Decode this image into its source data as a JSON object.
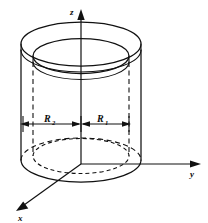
{
  "figure": {
    "kind": "technical-line-drawing",
    "background_color": "#ffffff",
    "line_color": "#111111"
  },
  "axes": {
    "z": {
      "label": "z",
      "direction": "up",
      "arrowhead": true
    },
    "y": {
      "label": "y",
      "direction": "right",
      "arrowhead": true
    },
    "x": {
      "label": "x",
      "direction": "down-left",
      "arrowhead": true
    },
    "origin_label": ""
  },
  "dimensions": [
    {
      "name": "outer-radius",
      "base": "R",
      "subscript": "2",
      "side": "left",
      "arrow_style": "double-headed"
    },
    {
      "name": "inner-radius",
      "base": "R",
      "subscript": "1",
      "side": "right",
      "arrow_style": "double-headed"
    }
  ],
  "geometry": {
    "top_outer_ellipse": "solid",
    "top_inner_ellipse": "solid",
    "wall_thickness_ring": "solid",
    "bottom_outer_front_arc": "solid",
    "bottom_outer_back_arc": "dashed",
    "bottom_inner_ellipse": "dashed",
    "inner_wall_verticals": "dashed",
    "outer_wall_verticals": "solid"
  }
}
